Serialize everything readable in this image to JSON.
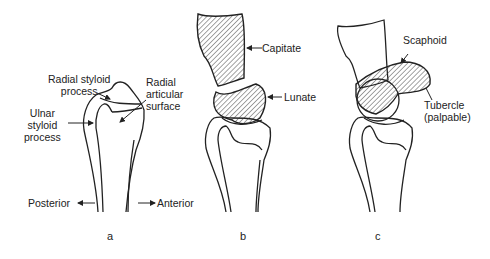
{
  "figure": {
    "panels": [
      {
        "id": "a",
        "caption": "a",
        "labels": {
          "radial_styloid": "Radial styloid\nprocess",
          "radial_styloid_line1": "Radial styloid",
          "radial_styloid_line2": "process",
          "radial_articular_line1": "Radial",
          "radial_articular_line2": "articular",
          "radial_articular_line3": "surface",
          "ulnar_line1": "Ulnar",
          "ulnar_line2": "styloid",
          "ulnar_line3": "process",
          "posterior": "Posterior",
          "anterior": "Anterior"
        }
      },
      {
        "id": "b",
        "caption": "b",
        "labels": {
          "capitate": "Capitate",
          "lunate": "Lunate"
        }
      },
      {
        "id": "c",
        "caption": "c",
        "labels": {
          "scaphoid": "Scaphoid",
          "tubercle_line1": "Tubercle",
          "tubercle_line2": "(palpable)"
        }
      }
    ]
  }
}
